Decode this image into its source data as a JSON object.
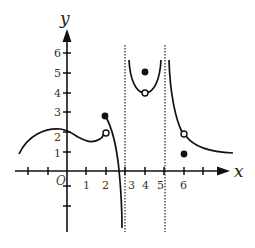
{
  "figure": {
    "type": "function-graph",
    "axes": {
      "x_label": "x",
      "y_label": "y",
      "origin_label": "O",
      "x_tick_labels": [
        "1",
        "2",
        "3",
        "4",
        "5",
        "6"
      ],
      "y_tick_labels": [
        "1",
        "2",
        "3",
        "4",
        "5",
        "6"
      ],
      "x_range": [
        -3,
        8
      ],
      "y_range": [
        -3,
        7
      ]
    },
    "asymptotes": [
      {
        "type": "vertical",
        "x": 3,
        "style": "dotted"
      },
      {
        "type": "vertical",
        "x": 5,
        "style": "dotted"
      }
    ],
    "curves": [
      {
        "name": "branch-1",
        "description": "from (-2.5,1) rising to ~(-0.5,2.2), dipping to ~(1.2,1.7), up to open circle at (2,2)"
      },
      {
        "name": "branch-2",
        "description": "from filled point (2,3) decreasing to -infinity as x approaches 3 from left"
      },
      {
        "name": "branch-3",
        "description": "U-shaped between x=3 and x=5, minimum at open circle (4,4), rising to +infinity near both asymptotes"
      },
      {
        "name": "branch-4",
        "description": "from +infinity near x=5 decreasing through open circle (6,2) toward y≈1.2 at x≈8.5"
      }
    ],
    "points": [
      {
        "x": 2,
        "y": 3,
        "kind": "filled"
      },
      {
        "x": 2,
        "y": 2,
        "kind": "open"
      },
      {
        "x": 4,
        "y": 5,
        "kind": "filled"
      },
      {
        "x": 4,
        "y": 4,
        "kind": "open"
      },
      {
        "x": 6,
        "y": 2,
        "kind": "open"
      },
      {
        "x": 6,
        "y": 1,
        "kind": "filled"
      }
    ]
  }
}
